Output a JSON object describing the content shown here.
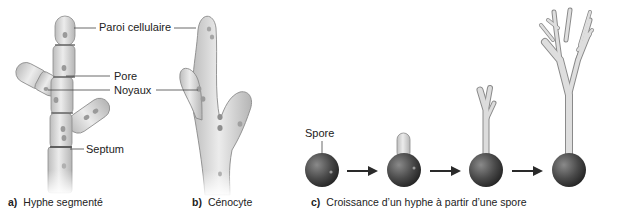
{
  "figure": {
    "panels": [
      {
        "id": "a",
        "letter": "a)",
        "caption": "Hyphe segmenté",
        "labels": {
          "cell_wall": "Paroi cellulaire",
          "pore": "Pore",
          "nuclei": "Noyaux",
          "septum": "Septum"
        }
      },
      {
        "id": "b",
        "letter": "b)",
        "caption": "Cénocyte"
      },
      {
        "id": "c",
        "letter": "c)",
        "caption": "Croissance d’un hyphe à partir d’une spore",
        "labels": {
          "spore": "Spore"
        },
        "stages": 4
      }
    ],
    "colors": {
      "hypha_fill": "#d4d4d4",
      "hypha_stroke": "#8a8a8a",
      "nucleus": "#9a9a9a",
      "spore": "#4a4a4a",
      "arrow": "#2a2a2a",
      "leader_line": "#444444"
    }
  }
}
